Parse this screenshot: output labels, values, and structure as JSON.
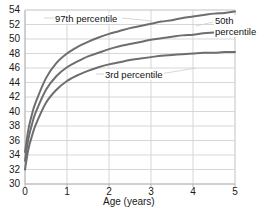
{
  "chart_data": {
    "type": "line",
    "title": "",
    "subtitle": "",
    "xlabel": "Age (years)",
    "ylabel": "",
    "xlim": [
      0,
      5
    ],
    "ylim": [
      30,
      54
    ],
    "xticks": [
      "0",
      "1",
      "2",
      "3",
      "4",
      "5"
    ],
    "yticks": [
      "30",
      "32",
      "34",
      "36",
      "38",
      "40",
      "42",
      "44",
      "46",
      "48",
      "50",
      "52",
      "54"
    ],
    "grid": "both",
    "legend_position": "inline-annotations",
    "x": [
      0,
      0.08,
      0.17,
      0.25,
      0.5,
      0.75,
      1,
      1.25,
      1.5,
      1.75,
      2,
      2.25,
      2.5,
      2.75,
      3,
      3.25,
      3.5,
      3.75,
      4,
      4.25,
      4.5,
      4.75,
      5
    ],
    "series": [
      {
        "name": "97th percentile",
        "color": "#6e6e6e",
        "values": [
          34.4,
          37.5,
          39.7,
          41.2,
          44.6,
          46.7,
          48.0,
          48.9,
          49.6,
          50.2,
          50.7,
          51.1,
          51.5,
          51.8,
          52.1,
          52.4,
          52.6,
          52.9,
          53.1,
          53.3,
          53.5,
          53.6,
          53.8
        ]
      },
      {
        "name": "50th percentile",
        "color": "#6e6e6e",
        "values": [
          33.2,
          36.2,
          38.3,
          39.8,
          43.0,
          44.9,
          46.1,
          46.9,
          47.6,
          48.1,
          48.6,
          49.0,
          49.3,
          49.6,
          49.9,
          50.1,
          50.3,
          50.5,
          50.6,
          50.8,
          50.9,
          51.0,
          51.0
        ]
      },
      {
        "name": "3rd percentile",
        "color": "#6e6e6e",
        "values": [
          32.0,
          34.8,
          36.7,
          38.1,
          41.2,
          43.0,
          44.2,
          45.0,
          45.6,
          46.1,
          46.5,
          46.8,
          47.1,
          47.3,
          47.5,
          47.7,
          47.8,
          47.9,
          48.0,
          48.1,
          48.1,
          48.2,
          48.2
        ]
      }
    ],
    "annotations": [
      {
        "text": "97th percentile",
        "series": "97th percentile"
      },
      {
        "text_line1": "50th",
        "text_line2": "percentile",
        "series": "50th percentile"
      },
      {
        "text": "3rd percentile",
        "series": "3rd percentile"
      }
    ],
    "colors": {
      "curve": "#6e6e6e",
      "grid": "#d2d2d2",
      "axis": "#b4b4b4",
      "text": "#1a1a1a",
      "background": "#ffffff"
    }
  }
}
